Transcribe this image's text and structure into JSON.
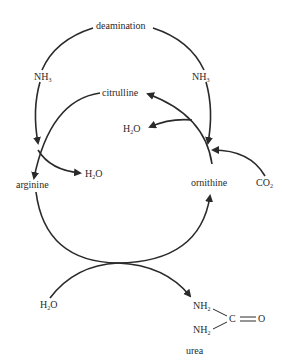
{
  "labels": {
    "deamination": "deamination",
    "nh3_left": "NH",
    "nh3_left_sub": "3",
    "nh3_right": "NH",
    "nh3_right_sub": "3",
    "citrulline": "citrulline",
    "h2o_mid": "H",
    "h2o_mid_sub": "2",
    "h2o_mid_tail": "O",
    "h2o_arg": "H",
    "h2o_arg_sub": "2",
    "h2o_arg_tail": "O",
    "arginine": "arginine",
    "ornithine": "ornithine",
    "co2": "CO",
    "co2_sub": "2",
    "h2o_bottom": "H",
    "h2o_bottom_sub": "2",
    "h2o_bottom_tail": "O",
    "urea_nh2_top": "NH",
    "urea_nh2_top_sub": "2",
    "urea_nh2_bottom": "NH",
    "urea_nh2_bottom_sub": "2",
    "urea_c": "C",
    "urea_o": "O",
    "urea": "urea"
  },
  "colors": {
    "stroke": "#2a2a2a",
    "background": "#ffffff"
  }
}
